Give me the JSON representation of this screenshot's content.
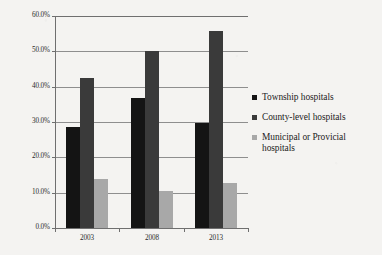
{
  "chart_data": {
    "type": "bar",
    "title": "",
    "subtitle": "",
    "xlabel": "",
    "ylabel": "",
    "categories": [
      "2003",
      "2008",
      "2013"
    ],
    "series": [
      {
        "name": "Township hospitals",
        "values": [
          28.7,
          36.7,
          29.7
        ],
        "color": "#141414"
      },
      {
        "name": "County-level hospitals",
        "values": [
          42.4,
          50.0,
          55.7
        ],
        "color": "#3a3a3a"
      },
      {
        "name": "Municipal or Provicial hospitals",
        "values": [
          13.9,
          10.4,
          12.6
        ],
        "color": "#a8a8a8"
      }
    ],
    "ylim": [
      0,
      60
    ],
    "ytick_values": [
      0,
      10,
      20,
      30,
      40,
      50,
      60
    ],
    "ytick_labels": [
      "0.0%",
      "10.0%",
      "20.0%",
      "30.0%",
      "40.0%",
      "50.0%",
      "60.0%"
    ],
    "grid": true,
    "legend_position": "right",
    "value_format": "percent"
  },
  "legend": {
    "items": [
      {
        "label": "Township hospitals"
      },
      {
        "label": "County-level hospitals"
      },
      {
        "label": "Municipal or Provicial hospitals"
      }
    ]
  },
  "colors": {
    "series_0": "#141414",
    "series_1": "#3a3a3a",
    "series_2": "#a8a8a8",
    "gridline": "#8e8e8e",
    "axis": "#6f6f6f",
    "background": "#f4f3f1",
    "text": "#1c1c1c"
  }
}
